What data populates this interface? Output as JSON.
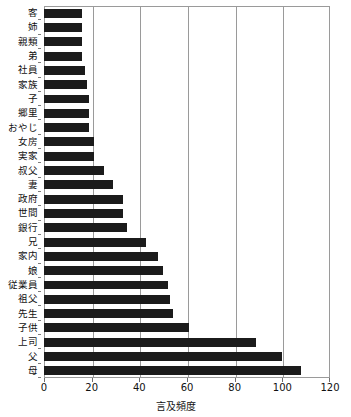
{
  "chart_data": {
    "type": "bar",
    "orientation": "horizontal",
    "title": "",
    "xlabel": "言及頻度",
    "ylabel": "",
    "xlim": [
      0,
      120
    ],
    "xticks": [
      0,
      20,
      40,
      60,
      80,
      100,
      120
    ],
    "grid": "vertical",
    "legend": "none",
    "bar_color": "#1b1b1b",
    "categories": [
      "客",
      "姉",
      "親類",
      "弟",
      "社員",
      "家族",
      "子",
      "郷里",
      "おやじ",
      "女房",
      "実家",
      "叔父",
      "妻",
      "政府",
      "世間",
      "銀行",
      "兄",
      "家内",
      "娘",
      "従業員",
      "祖父",
      "先生",
      "子供",
      "上司",
      "父",
      "母"
    ],
    "values": [
      16,
      16,
      16,
      16,
      17,
      18,
      19,
      19,
      19,
      21,
      21,
      25,
      29,
      33,
      33,
      35,
      43,
      48,
      50,
      52,
      53,
      54,
      61,
      89,
      100,
      108
    ]
  }
}
